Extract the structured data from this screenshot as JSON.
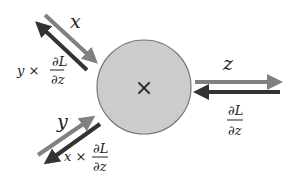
{
  "diagram": {
    "node": {
      "operator": "×",
      "fill": "#cccccc",
      "stroke": "#777777"
    },
    "inputs": [
      {
        "name": "x",
        "forward_label": "x",
        "backward_label_prefix": "y ×",
        "backward_num": "∂L",
        "backward_den": "∂z"
      },
      {
        "name": "y",
        "forward_label": "y",
        "backward_label_prefix": "x ×",
        "backward_num": "∂L",
        "backward_den": "∂z"
      }
    ],
    "output": {
      "name": "z",
      "forward_label": "z",
      "backward_num": "∂L",
      "backward_den": "∂z"
    },
    "colors": {
      "forward_arrow": "#808080",
      "backward_arrow": "#333333",
      "text": "#222222"
    }
  }
}
